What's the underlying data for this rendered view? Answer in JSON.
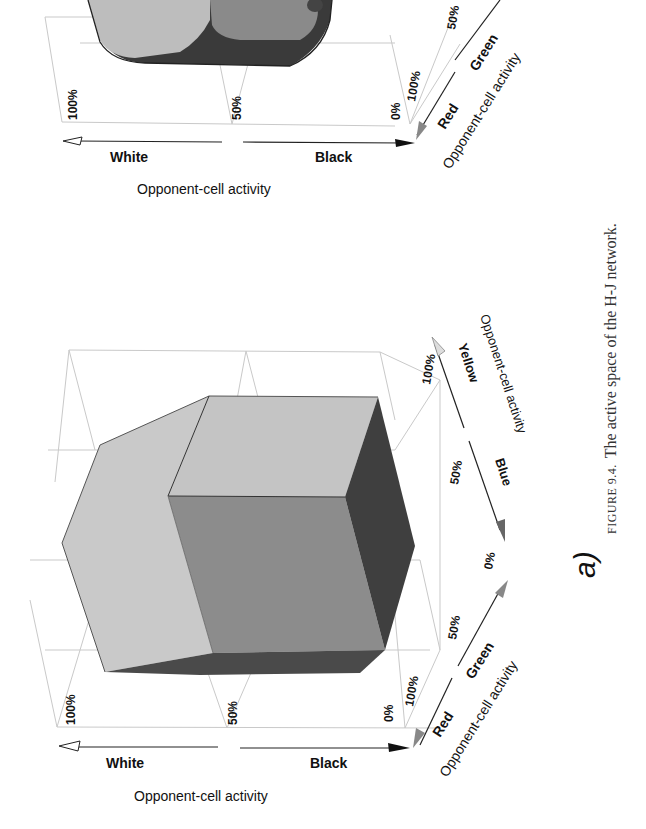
{
  "page": {
    "orientation": "rotated 90 degrees counter-clockwise",
    "caption": {
      "prefix": "FIGURE 9.4.",
      "text": "The active space of the H-J network."
    }
  },
  "figure_b_partial": {
    "axes": {
      "vertical_axis": {
        "title": "Opponent-cell activity",
        "left_label": "White",
        "right_label": "Black",
        "ticks": [
          "100%",
          "50%",
          "0%"
        ]
      },
      "red_green_axis": {
        "title": "Opponent-cell activity",
        "near_label": "Red",
        "far_label": "Green",
        "ticks": [
          "100%",
          "50%"
        ]
      }
    }
  },
  "figure_a": {
    "panel_label": "a)",
    "axes": {
      "vertical_axis": {
        "title": "Opponent-cell activity",
        "left_label": "White",
        "right_label": "Black",
        "ticks": [
          "100%",
          "50%",
          "0%"
        ]
      },
      "red_green_axis": {
        "title": "Opponent-cell activity",
        "near_label": "Red",
        "far_label": "Green",
        "ticks": [
          "100%",
          "50%",
          "0%"
        ]
      },
      "blue_yellow_axis": {
        "title": "Opponent-cell activity",
        "near_label": "Blue",
        "far_label": "Yellow",
        "ticks": [
          "50%",
          "100%"
        ]
      }
    },
    "shape": "truncated cube (hexagonal prism silhouette)",
    "colors": {
      "light_face": "#c4c4c4",
      "mid_face": "#8a8a8a",
      "dark_face": "#3e3e3e",
      "grid": "#c9c9c9"
    }
  }
}
